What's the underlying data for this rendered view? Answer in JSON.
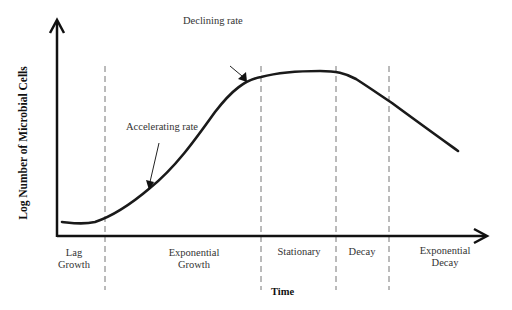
{
  "diagram": {
    "y_axis_label": "Log Number of Microbial Cells",
    "x_axis_label": "Time",
    "phases": [
      {
        "line1": "Lag",
        "line2": "Growth"
      },
      {
        "line1": "Exponential",
        "line2": "Growth"
      },
      {
        "line1": "Stationary",
        "line2": ""
      },
      {
        "line1": "Decay",
        "line2": ""
      },
      {
        "line1": "Exponential",
        "line2": "Decay"
      }
    ],
    "annotations": {
      "accelerating": "Accelerating rate",
      "declining": "Declining rate"
    },
    "colors": {
      "axis": "#111111",
      "curve": "#1a1a1a",
      "dashed": "#777777",
      "text": "#333333"
    }
  }
}
